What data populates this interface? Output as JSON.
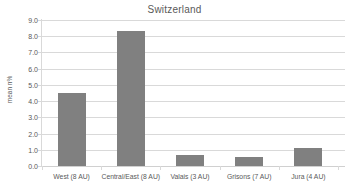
{
  "chart_data": {
    "type": "bar",
    "title": "Switzerland",
    "xlabel": "",
    "ylabel": "mean n%",
    "categories": [
      "West (8 AU)",
      "Central/East (8 AU)",
      "Valais (3 AU)",
      "Grisons (7 AU)",
      "Jura (4 AU)"
    ],
    "values": [
      4.5,
      8.3,
      0.65,
      0.55,
      1.1
    ],
    "ylim": [
      0.0,
      9.0
    ],
    "ytick_labels": [
      "9.0",
      "8.0",
      "7.0",
      "6.0",
      "5.0",
      "4.0",
      "3.0",
      "2.0",
      "1.0",
      "0.0"
    ],
    "ytick_values": [
      9.0,
      8.0,
      7.0,
      6.0,
      5.0,
      4.0,
      3.0,
      2.0,
      1.0,
      0.0
    ],
    "grid": true,
    "legend": false,
    "legend_position": "none",
    "series": [
      {
        "name": "mean n%",
        "color": "#808080",
        "values": [
          4.5,
          8.3,
          0.65,
          0.55,
          1.1
        ]
      }
    ]
  },
  "colors": {
    "bar": "#808080",
    "grid": "#d9d9d9",
    "text": "#595959",
    "background": "#ffffff"
  }
}
